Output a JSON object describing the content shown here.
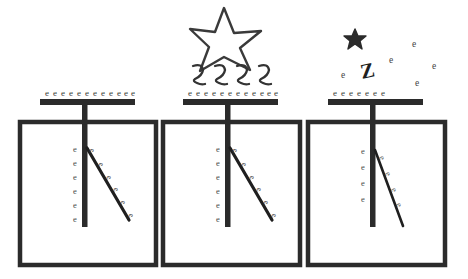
{
  "diagram": {
    "symbols": {
      "electron": "e",
      "photon_squiggle": "photon-squiggle",
      "photon_bold": "Z",
      "star_outline": "star-outline-icon",
      "star_small": "star-small-icon"
    },
    "colors": {
      "ink": "#2b2b2b",
      "ink_light": "#3f3f3f",
      "background": "#ffffff",
      "leaf": "#1f1f1f"
    }
  },
  "panels": [
    {
      "id": "panel-charged",
      "name": "charged-electroscope",
      "box": {
        "x": 20,
        "y": 122,
        "w": 136,
        "h": 143
      },
      "plate": {
        "x": 40,
        "y": 99,
        "w": 95,
        "h": 6
      },
      "stem": {
        "x": 85,
        "y_top": 99,
        "y_bottom": 227
      },
      "plate_electron_count": 12,
      "plate_electrons": [
        "e",
        "e",
        "e",
        "e",
        "e",
        "e",
        "e",
        "e",
        "e",
        "e",
        "e",
        "e"
      ],
      "rod_electron_count": 6,
      "rod_electrons": [
        "e",
        "e",
        "e",
        "e",
        "e",
        "e"
      ],
      "leaf": {
        "x1": 87,
        "y1": 148,
        "x2": 129,
        "y2": 220,
        "angle_label": "wide"
      },
      "leaf_electron_count": 6,
      "leaf_electrons": [
        "e",
        "e",
        "e",
        "e",
        "e",
        "e"
      ],
      "has_light_source": false,
      "has_free_electrons": false
    },
    {
      "id": "panel-illuminated",
      "name": "electroscope-illuminated-by-light",
      "box": {
        "x": 163,
        "y": 122,
        "w": 137,
        "h": 143
      },
      "plate": {
        "x": 183,
        "y": 99,
        "w": 95,
        "h": 6
      },
      "stem": {
        "x": 228,
        "y_top": 99,
        "y_bottom": 227
      },
      "plate_electron_count": 12,
      "plate_electrons": [
        "e",
        "e",
        "e",
        "e",
        "e",
        "e",
        "e",
        "e",
        "e",
        "e",
        "e",
        "e"
      ],
      "rod_electron_count": 6,
      "rod_electrons": [
        "e",
        "e",
        "e",
        "e",
        "e",
        "e"
      ],
      "leaf": {
        "x1": 230,
        "y1": 148,
        "x2": 272,
        "y2": 220,
        "angle_label": "wide"
      },
      "leaf_electron_count": 6,
      "leaf_electrons": [
        "e",
        "e",
        "e",
        "e",
        "e",
        "e"
      ],
      "has_light_source": true,
      "light_source": {
        "star": {
          "cx": 224,
          "cy": 33,
          "r": 27,
          "style": "outline"
        },
        "squiggle_count": 4,
        "squiggles": [
          "photon",
          "photon",
          "photon",
          "photon"
        ]
      },
      "has_free_electrons": false
    },
    {
      "id": "panel-discharging",
      "name": "electroscope-emitting-electrons",
      "box": {
        "x": 308,
        "y": 122,
        "w": 137,
        "h": 143
      },
      "plate": {
        "x": 328,
        "y": 99,
        "w": 95,
        "h": 6
      },
      "stem": {
        "x": 373,
        "y_top": 99,
        "y_bottom": 227
      },
      "plate_electron_count": 7,
      "plate_electrons": [
        "e",
        "e",
        "e",
        "e",
        "e",
        "e",
        "e"
      ],
      "rod_electron_count": 4,
      "rod_electrons": [
        "e",
        "e",
        "e",
        "e"
      ],
      "leaf": {
        "x1": 375,
        "y1": 150,
        "x2": 403,
        "y2": 226,
        "angle_label": "narrow"
      },
      "leaf_electron_count": 4,
      "leaf_electrons": [
        "e",
        "e",
        "e",
        "e"
      ],
      "has_light_source": true,
      "light_source": {
        "star": {
          "cx": 355,
          "cy": 38,
          "r": 8,
          "style": "filled-small"
        },
        "squiggle_count": 1,
        "squiggles": [
          "Z"
        ]
      },
      "has_free_electrons": true,
      "free_electron_count": 5,
      "free_electrons": [
        {
          "label": "e",
          "x": 341,
          "y": 78
        },
        {
          "label": "e",
          "x": 389,
          "y": 63
        },
        {
          "label": "e",
          "x": 412,
          "y": 47
        },
        {
          "label": "e",
          "x": 432,
          "y": 69
        },
        {
          "label": "e",
          "x": 415,
          "y": 86
        }
      ]
    }
  ]
}
